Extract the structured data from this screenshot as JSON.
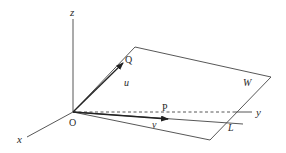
{
  "diagram": {
    "type": "3d-coordinate-geometry",
    "axes": {
      "x_label": "x",
      "y_label": "y",
      "z_label": "z",
      "origin_label": "O"
    },
    "points": {
      "Q": "Q",
      "P": "P"
    },
    "vectors": {
      "u": "u",
      "v": "v"
    },
    "plane_label": "W",
    "line_label": "L",
    "colors": {
      "line": "#333333",
      "text": "#2a2a2a",
      "background": "#ffffff"
    }
  }
}
